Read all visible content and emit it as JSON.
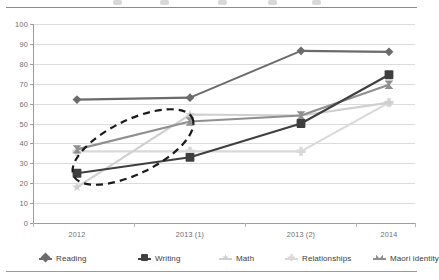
{
  "chart_data": {
    "type": "line",
    "title": "",
    "xlabel": "",
    "ylabel": "",
    "x": [
      "2012",
      "2013 (1)",
      "2013 (2)",
      "2014"
    ],
    "categories": [
      "2012",
      "2013 (1)",
      "2013 (2)",
      "2014"
    ],
    "ylim": [
      0,
      100
    ],
    "ytick_step": 10,
    "yticks": [
      "0",
      "10",
      "20",
      "30",
      "40",
      "50",
      "60",
      "70",
      "80",
      "90",
      "100"
    ],
    "grid": "horizontal",
    "legend_position": "bottom",
    "series": [
      {
        "name": "Reading",
        "marker": "diamond",
        "color": "#6b6b6b",
        "values": [
          62,
          63,
          86.5,
          86
        ]
      },
      {
        "name": "Writing",
        "marker": "square",
        "color": "#3f3f3f",
        "values": [
          25,
          33,
          50,
          74.5
        ]
      },
      {
        "name": "Math",
        "marker": "star",
        "color": "#cfcfcf",
        "values": [
          18,
          54.5,
          54,
          60.5
        ]
      },
      {
        "name": "Relationships",
        "marker": "plus-x",
        "color": "#d9d9d9",
        "values": [
          36,
          36,
          36,
          60.5
        ]
      },
      {
        "name": "Maori identity",
        "marker": "bowtie",
        "color": "#8f8f8f",
        "values": [
          37,
          51,
          54,
          69.5
        ]
      }
    ],
    "annotations": [
      {
        "type": "ellipse",
        "style": "dashed",
        "color": "#1a1a1a",
        "label": "",
        "note": "dashed oval highlighting 2012 to 2013 (1) region"
      }
    ]
  },
  "legend": {
    "items": [
      {
        "label": "Reading"
      },
      {
        "label": "Writing"
      },
      {
        "label": "Math"
      },
      {
        "label": "Relationships"
      },
      {
        "label": "Maori identity"
      }
    ]
  }
}
